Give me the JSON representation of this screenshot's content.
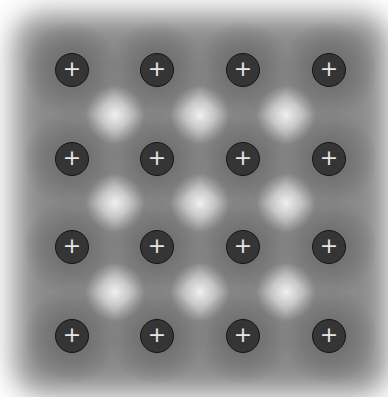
{
  "diagram": {
    "ion_symbol": "+",
    "rows": 4,
    "cols": 4,
    "col_x": [
      72,
      157,
      243,
      329
    ],
    "row_y": [
      70,
      159,
      247,
      336
    ],
    "colors": {
      "ion_fill": "#353535",
      "ion_border": "#151515",
      "ion_symbol": "#e6e6e6",
      "electron_sea": "#8a8a8a",
      "background": "#ffffff"
    }
  }
}
